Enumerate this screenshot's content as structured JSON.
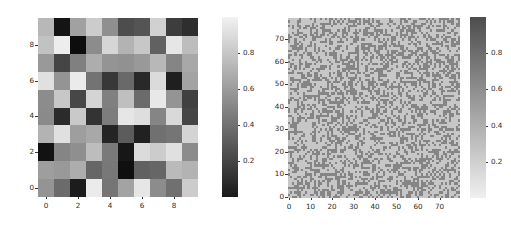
{
  "figure": {
    "background": "#ffffff",
    "width": 511,
    "height": 226
  },
  "chart_data": [
    {
      "type": "heatmap",
      "name": "coarse-random-heatmap",
      "title": "",
      "xlabel": "",
      "ylabel": "",
      "rows": 10,
      "cols": 10,
      "xlim": [
        -0.5,
        9.5
      ],
      "ylim": [
        9.5,
        -0.5
      ],
      "xticks": [
        0,
        2,
        4,
        6,
        8
      ],
      "yticks": [
        0,
        2,
        4,
        6,
        8
      ],
      "xticklabels": [
        "0",
        "2",
        "4",
        "6",
        "8"
      ],
      "yticklabels": [
        "0",
        "2",
        "4",
        "6",
        "8"
      ],
      "grid": false,
      "colormap": "gray",
      "colormap_direction": "light-high",
      "vmin": 0.0,
      "vmax": 1.0,
      "colorbar": {
        "ticks": [
          0.2,
          0.4,
          0.6,
          0.8
        ],
        "ticklabels": [
          "0.2",
          "0.4",
          "0.6",
          "0.8"
        ],
        "position": "right",
        "top_color": "#f2f2f2",
        "bottom_color": "#1a1a1a"
      },
      "values": [
        [
          0.72,
          0.08,
          0.63,
          0.8,
          0.56,
          0.3,
          0.33,
          0.82,
          0.24,
          0.18
        ],
        [
          0.76,
          0.93,
          0.05,
          0.55,
          0.84,
          0.7,
          0.78,
          0.38,
          0.9,
          0.74
        ],
        [
          0.6,
          0.27,
          0.5,
          0.68,
          0.58,
          0.57,
          0.6,
          0.72,
          0.52,
          0.66
        ],
        [
          0.88,
          0.58,
          0.92,
          0.45,
          0.22,
          0.41,
          0.16,
          0.86,
          0.12,
          0.64
        ],
        [
          0.55,
          0.78,
          0.28,
          0.83,
          0.5,
          0.75,
          0.42,
          0.91,
          0.58,
          0.25
        ],
        [
          0.54,
          0.17,
          0.79,
          0.2,
          0.49,
          0.9,
          0.87,
          0.52,
          0.85,
          0.27
        ],
        [
          0.7,
          0.88,
          0.62,
          0.66,
          0.14,
          0.36,
          0.13,
          0.44,
          0.46,
          0.83
        ],
        [
          0.07,
          0.52,
          0.56,
          0.74,
          0.48,
          0.09,
          0.86,
          0.8,
          0.88,
          0.55
        ],
        [
          0.62,
          0.6,
          0.68,
          0.4,
          0.47,
          0.06,
          0.38,
          0.4,
          0.73,
          0.7
        ],
        [
          0.58,
          0.42,
          0.11,
          0.92,
          0.46,
          0.64,
          0.9,
          0.55,
          0.44,
          0.8
        ]
      ]
    },
    {
      "type": "heatmap",
      "name": "fine-noise-heatmap",
      "title": "",
      "xlabel": "",
      "ylabel": "",
      "rows": 80,
      "cols": 80,
      "xlim": [
        -0.5,
        79.5
      ],
      "ylim": [
        79.5,
        -0.5
      ],
      "xticks": [
        0,
        10,
        20,
        30,
        40,
        50,
        60,
        70
      ],
      "yticks": [
        0,
        10,
        20,
        30,
        40,
        50,
        60,
        70
      ],
      "xticklabels": [
        "0",
        "10",
        "20",
        "30",
        "40",
        "50",
        "60",
        "70"
      ],
      "yticklabels": [
        "0",
        "10",
        "20",
        "30",
        "40",
        "50",
        "60",
        "70"
      ],
      "grid": false,
      "colormap": "gray_r",
      "colormap_direction": "dark-high",
      "vmin": 0.0,
      "vmax": 1.0,
      "noise": {
        "distribution": "uniform-binary-speckle",
        "seed": 20250607,
        "low_level": 0.52,
        "high_level": 0.78,
        "light_fraction": 0.42
      },
      "colorbar": {
        "ticks": [
          0.2,
          0.4,
          0.6,
          0.8
        ],
        "ticklabels": [
          "0.2",
          "0.4",
          "0.6",
          "0.8"
        ],
        "position": "right",
        "top_color": "#4d4d4d",
        "bottom_color": "#f0f0f0"
      }
    }
  ],
  "layout": {
    "left_panel": {
      "axes": {
        "x": 38,
        "y": 18,
        "w": 160,
        "h": 179
      },
      "colorbar": {
        "x": 222,
        "y": 17,
        "w": 16,
        "h": 180
      }
    },
    "right_panel": {
      "axes": {
        "x": 288,
        "y": 18,
        "w": 172,
        "h": 180
      },
      "colorbar": {
        "x": 470,
        "y": 17,
        "w": 16,
        "h": 181
      }
    }
  }
}
